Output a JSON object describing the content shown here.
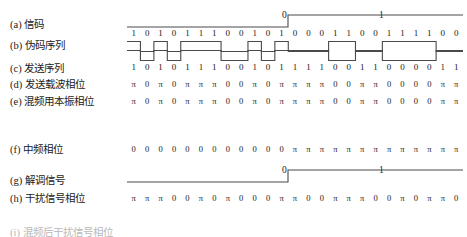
{
  "figure": {
    "symbol_count": 25,
    "line_color": "#4a4a4a",
    "text_color": "#1a1a1a"
  },
  "rows": [
    {
      "id": "signal",
      "label": "(a) 信码",
      "type": "step",
      "bits": [
        "0",
        "1"
      ],
      "transition_index": 12
    },
    {
      "id": "pn-sequence",
      "label": "(b) 伪码序列",
      "type": "digits-with-pulse",
      "symbols": [
        "1",
        "0",
        "1",
        "0",
        "1",
        "1",
        "1",
        "0",
        "0",
        "1",
        "0",
        "1",
        "0",
        "0",
        "0",
        "1",
        "1",
        "0",
        "0",
        "1",
        "1",
        "1",
        "1",
        "0",
        "0"
      ]
    },
    {
      "id": "tx-sequence",
      "label": "(c) 发送序列",
      "type": "digits-with-pulse",
      "symbols": [
        "1",
        "0",
        "1",
        "0",
        "1",
        "1",
        "1",
        "0",
        "0",
        "1",
        "0",
        "1",
        "1",
        "1",
        "1",
        "0",
        "0",
        "1",
        "1",
        "0",
        "0",
        "0",
        "0",
        "1",
        "1"
      ]
    },
    {
      "id": "tx-carrier-phase",
      "label": "(d) 发送载波相位",
      "type": "phase",
      "symbols": [
        "π",
        "0",
        "π",
        "0",
        "π",
        "π",
        "π",
        "0",
        "0",
        "π",
        "0",
        "π",
        "π",
        "π",
        "π",
        "0",
        "0",
        "π",
        "π",
        "0",
        "0",
        "0",
        "0",
        "π",
        "π"
      ]
    },
    {
      "id": "local-osc-phase",
      "label": "(e) 混频用本振相位",
      "type": "phase",
      "symbols": [
        "π",
        "0",
        "π",
        "0",
        "π",
        "π",
        "π",
        "0",
        "0",
        "π",
        "0",
        "π",
        "π",
        "π",
        "π",
        "0",
        "0",
        "π",
        "π",
        "0",
        "0",
        "0",
        "0",
        "π",
        "π"
      ]
    },
    {
      "id": "if-phase",
      "label": "(f) 中频相位",
      "type": "phase",
      "symbols": [
        "0",
        "0",
        "0",
        "0",
        "0",
        "0",
        "0",
        "0",
        "0",
        "0",
        "0",
        "0",
        "π",
        "π",
        "π",
        "π",
        "π",
        "π",
        "π",
        "π",
        "π",
        "π",
        "π",
        "π",
        "π"
      ]
    },
    {
      "id": "demodulated-signal",
      "label": "(g) 解调信号",
      "type": "step",
      "bits": [
        "0",
        "1"
      ],
      "transition_index": 12
    },
    {
      "id": "interference-phase",
      "label": "(h) 干扰信号相位",
      "type": "phase",
      "symbols": [
        "π",
        "π",
        "π",
        "0",
        "0",
        "π",
        "0",
        "π",
        "0",
        "0",
        "0",
        "π",
        "π",
        "0",
        "0",
        "π",
        "π",
        "π",
        "0",
        "0",
        "π",
        "0",
        "π",
        "π",
        "0"
      ]
    },
    {
      "id": "cutoff-row",
      "label": "(i) 混频后干扰信号相位",
      "type": "cutoff"
    }
  ]
}
